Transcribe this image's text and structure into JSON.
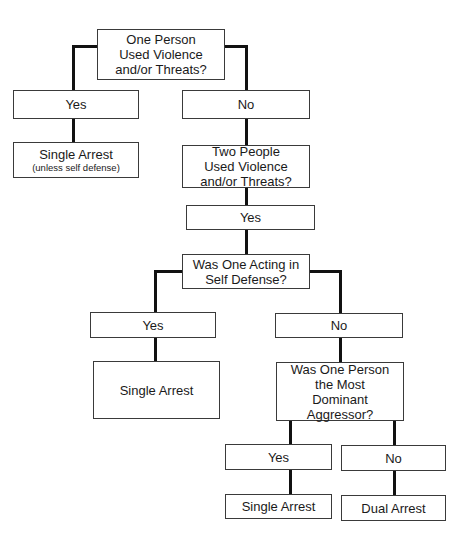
{
  "flowchart": {
    "q1": {
      "lines": [
        "One Person",
        "Used Violence",
        "and/or Threats?"
      ]
    },
    "q1_yes": {
      "label": "Yes"
    },
    "q1_no": {
      "label": "No"
    },
    "r1": {
      "label": "Single Arrest",
      "sub": "(unless self defense)"
    },
    "q2": {
      "lines": [
        "Two People",
        "Used Violence",
        "and/or Threats?"
      ]
    },
    "q2_yes": {
      "label": "Yes"
    },
    "q3": {
      "lines": [
        "Was One Acting in",
        "Self Defense?"
      ]
    },
    "q3_yes": {
      "label": "Yes"
    },
    "q3_no": {
      "label": "No"
    },
    "r2": {
      "label": "Single Arrest"
    },
    "q4": {
      "lines": [
        "Was One Person",
        "the Most",
        "Dominant",
        "Aggressor?"
      ]
    },
    "q4_yes": {
      "label": "Yes"
    },
    "q4_no": {
      "label": "No"
    },
    "r3": {
      "label": "Single Arrest"
    },
    "r4": {
      "label": "Dual Arrest"
    }
  }
}
